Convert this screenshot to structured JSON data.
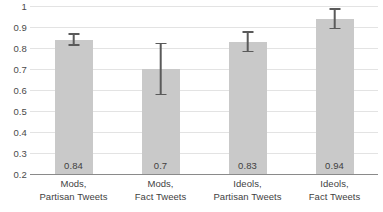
{
  "chart_data": {
    "type": "bar",
    "title": "",
    "subtitle": "",
    "xlabel": "",
    "ylabel": "",
    "categories": [
      "Mods, Partisan Tweets",
      "Mods, Fact Tweets",
      "Ideols, Partisan Tweets",
      "Ideols, Fact Tweets"
    ],
    "category_lines": [
      [
        "Mods,",
        "Partisan Tweets"
      ],
      [
        "Mods,",
        "Fact Tweets"
      ],
      [
        "Ideols,",
        "Partisan Tweets"
      ],
      [
        "Ideols,",
        "Fact Tweets"
      ]
    ],
    "values": [
      0.84,
      0.7,
      0.83,
      0.94
    ],
    "value_labels": [
      "0.84",
      "0.7",
      "0.83",
      "0.94"
    ],
    "error_bars": {
      "lower": [
        0.81,
        0.575,
        0.78,
        0.89
      ],
      "upper": [
        0.87,
        0.825,
        0.88,
        0.99
      ]
    },
    "ylim": [
      0.2,
      1.0
    ],
    "ytick_values": [
      0.2,
      0.3,
      0.4,
      0.5,
      0.6,
      0.7,
      0.8,
      0.9,
      1.0
    ],
    "ytick_labels": [
      "0.2",
      "0.3",
      "0.4",
      "0.5",
      "0.6",
      "0.7",
      "0.8",
      "0.9",
      "1"
    ],
    "grid": true,
    "legend": false,
    "legend_position": "none",
    "colors": {
      "bar_fill": "#c9c9c9",
      "error_bar": "#5a5a5a",
      "gridline": "#e3e3e3",
      "axis_line": "#8a8a8a",
      "text": "#3f3f3f",
      "background": "#ffffff"
    }
  }
}
